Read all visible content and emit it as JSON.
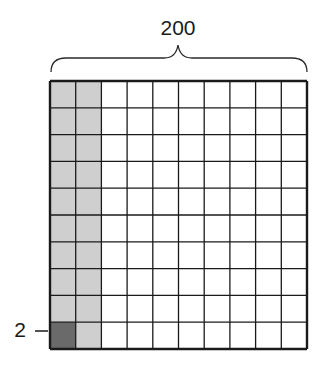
{
  "diagram": {
    "top_label": "200",
    "side_label": "2",
    "grid": {
      "rows": 10,
      "cols": 10,
      "shaded_columns": [
        0,
        1
      ],
      "highlight_cell": {
        "row": 9,
        "col": 0
      }
    },
    "colors": {
      "light_shade": "#cfcfcf",
      "dark_shade": "#6a6a6a",
      "line": "#1a1a1a",
      "background": "#ffffff"
    }
  }
}
